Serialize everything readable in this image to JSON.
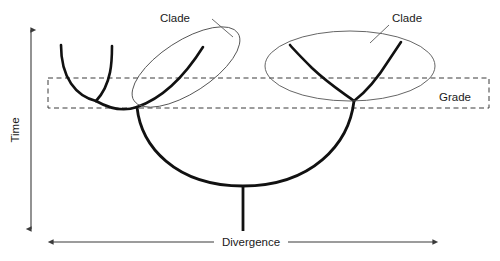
{
  "figure": {
    "background_color": "#ffffff",
    "branch_color": "#111111",
    "ellipse_color": "#555555",
    "dashed_color": "#3a3a3a"
  },
  "axes": {
    "y": {
      "label": "Time",
      "orientation": "vertical",
      "arrowheads": "both",
      "x": 31,
      "y_top": 27,
      "y_bottom": 232
    },
    "x": {
      "label": "Divergence",
      "orientation": "horizontal",
      "arrowheads": "both",
      "y": 242,
      "x_left": 50,
      "x_right": 436
    }
  },
  "annotations": {
    "clade_left": {
      "label": "Clade",
      "text_x": 175,
      "text_y": 22,
      "leader_from_x": 212,
      "leader_from_y": 19,
      "leader_to_x": 231,
      "leader_to_y": 36
    },
    "clade_right": {
      "label": "Clade",
      "text_x": 392,
      "text_y": 22,
      "leader_from_x": 389,
      "leader_from_y": 25,
      "leader_to_x": 372,
      "leader_to_y": 42
    },
    "grade": {
      "label": "Grade",
      "text_x": 455,
      "text_y": 101,
      "box_x": 48,
      "box_y": 78,
      "box_width": 441,
      "box_height": 30
    }
  },
  "ellipses": {
    "left_clade": {
      "center_x": 186,
      "center_y": 67,
      "radius_x": 62,
      "radius_y": 26,
      "rotation_deg": -33
    },
    "right_clade": {
      "center_x": 350,
      "center_y": 66,
      "radius_x": 85,
      "radius_y": 35,
      "rotation_deg": 0
    }
  },
  "branches": {
    "trunk_stem": {
      "x": 243,
      "y_top": 186,
      "y_bottom": 231
    },
    "main_arc": "large U-shaped arc joining left and right clade bases through the basal node",
    "left_clade_branch": "V-shaped split inside the left, tilted ellipse",
    "right_clade_branch": "V-shaped split inside the right, horizontal ellipse",
    "outer_left_branch": "U-shaped sister branch at far left, outside the ellipse"
  }
}
